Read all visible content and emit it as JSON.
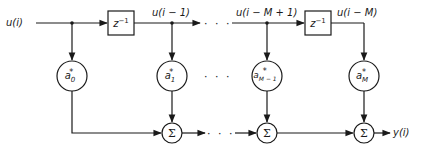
{
  "diagram": {
    "type": "transversal filter (tapped delay line)",
    "input_label": "u(i)",
    "output_label": "y(i)",
    "delay_label": "z",
    "delay_exponent": "−1",
    "tap_labels": [
      "u(i − 1)",
      "u(i − M + 1)",
      "u(i − M)"
    ],
    "coefficients": [
      {
        "base": "a",
        "sub": "0",
        "sup": "*"
      },
      {
        "base": "a",
        "sub": "1",
        "sup": "*"
      },
      {
        "base": "a",
        "sub": "M − 1",
        "sup": "*"
      },
      {
        "base": "a",
        "sub": "M",
        "sup": "*"
      }
    ],
    "summer_symbol": "Σ",
    "ellipsis": "· · ·"
  },
  "colors": {
    "line": "#1a1a1a",
    "background": "#ffffff"
  }
}
